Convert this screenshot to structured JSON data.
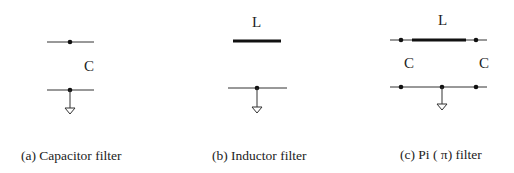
{
  "panels": [
    {
      "id": "a",
      "caption": "(a) Capacitor filter",
      "labels": {
        "capacitor": "C"
      }
    },
    {
      "id": "b",
      "caption": "(b) Inductor filter",
      "labels": {
        "inductor": "L"
      }
    },
    {
      "id": "c",
      "caption": "(c) Pi ( π) filter",
      "labels": {
        "inductor": "L",
        "capacitor_left": "C",
        "capacitor_right": "C"
      }
    }
  ],
  "colors": {
    "line": "#333333",
    "background": "#ffffff"
  }
}
